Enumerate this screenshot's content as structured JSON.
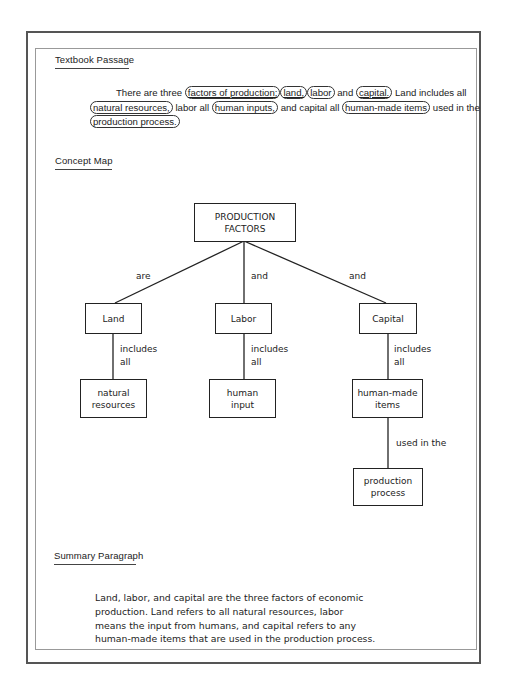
{
  "textbook_passage": {
    "title": "Textbook Passage",
    "segments": [
      {
        "text": "There are three ",
        "circled": false
      },
      {
        "text": "factors of production;",
        "circled": true,
        "underlined": true
      },
      {
        "text": "land,",
        "circled": true,
        "underlined": true
      },
      {
        "text": "labor",
        "circled": true
      },
      {
        "text": " and ",
        "circled": false
      },
      {
        "text": "capital.",
        "circled": true,
        "underlined": true
      },
      {
        "text": " Land includes all ",
        "circled": false
      },
      {
        "text": "natural resources,",
        "circled": true
      },
      {
        "text": " labor all ",
        "circled": false
      },
      {
        "text": "human inputs,",
        "circled": true
      },
      {
        "text": " and capital all ",
        "circled": false
      },
      {
        "text": "human-made items",
        "circled": true
      },
      {
        "text": " used in the ",
        "circled": false
      },
      {
        "text": "production process.",
        "circled": true
      }
    ]
  },
  "concept_map": {
    "title": "Concept Map",
    "root": "PRODUCTION FACTORS",
    "root_lines": [
      "PRODUCTION",
      "FACTORS"
    ],
    "branches": [
      {
        "link": "are",
        "node": "Land",
        "sub_link_lines": [
          "includes",
          "all"
        ],
        "leaf_lines": [
          "natural",
          "resources"
        ]
      },
      {
        "link": "and",
        "node": "Labor",
        "sub_link_lines": [
          "includes",
          "all"
        ],
        "leaf_lines": [
          "human",
          "input"
        ]
      },
      {
        "link": "and",
        "node": "Capital",
        "sub_link_lines": [
          "includes",
          "all"
        ],
        "leaf_lines": [
          "human-made",
          "items"
        ],
        "extra_link": "used in the",
        "extra_leaf_lines": [
          "production",
          "process"
        ]
      }
    ]
  },
  "summary": {
    "title": "Summary Paragraph",
    "lines": [
      "Land, labor, and capital are the three factors of economic",
      "production. Land refers to all natural resources, labor",
      "means the input from humans, and capital refers to any",
      "human-made items that are used in the production process."
    ]
  }
}
